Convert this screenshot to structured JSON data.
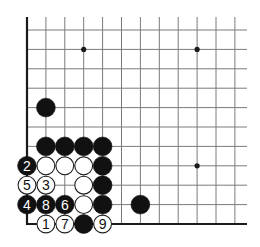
{
  "diagram": {
    "board": {
      "corner": "bottom-left",
      "visible_columns": 12,
      "visible_rows": 11,
      "origin": {
        "x": 27,
        "y": 224
      },
      "col_spacing": 18.9,
      "row_spacing": 19.4,
      "top_line_extent": 17,
      "right_line_extent": 247,
      "colors": {
        "background": "#ffffff",
        "grid_line": "#7a7a7a",
        "edge_line": "#1a1a1a",
        "black_stone": "#111111",
        "white_stone": "#ffffff",
        "white_stone_border": "#222222",
        "label_on_black": "#ffffff",
        "label_on_white": "#111111"
      }
    },
    "star_points": [
      {
        "col": 3,
        "row": 9
      },
      {
        "col": 9,
        "row": 9
      },
      {
        "col": 9,
        "row": 3
      }
    ],
    "stones": [
      {
        "col": 1,
        "row": 6,
        "color": "black",
        "label": ""
      },
      {
        "col": 1,
        "row": 4,
        "color": "black",
        "label": ""
      },
      {
        "col": 2,
        "row": 4,
        "color": "black",
        "label": ""
      },
      {
        "col": 3,
        "row": 4,
        "color": "black",
        "label": ""
      },
      {
        "col": 4,
        "row": 4,
        "color": "black",
        "label": ""
      },
      {
        "col": 0,
        "row": 3,
        "color": "black",
        "label": "2"
      },
      {
        "col": 1,
        "row": 3,
        "color": "white",
        "label": ""
      },
      {
        "col": 2,
        "row": 3,
        "color": "white",
        "label": ""
      },
      {
        "col": 3,
        "row": 3,
        "color": "white",
        "label": ""
      },
      {
        "col": 4,
        "row": 3,
        "color": "black",
        "label": ""
      },
      {
        "col": 0,
        "row": 2,
        "color": "white",
        "label": "5"
      },
      {
        "col": 1,
        "row": 2,
        "color": "white",
        "label": "3"
      },
      {
        "col": 3,
        "row": 2,
        "color": "white",
        "label": ""
      },
      {
        "col": 4,
        "row": 2,
        "color": "black",
        "label": ""
      },
      {
        "col": 0,
        "row": 1,
        "color": "black",
        "label": "4"
      },
      {
        "col": 1,
        "row": 1,
        "color": "black",
        "label": "8"
      },
      {
        "col": 2,
        "row": 1,
        "color": "black",
        "label": "6"
      },
      {
        "col": 3,
        "row": 1,
        "color": "white",
        "label": ""
      },
      {
        "col": 4,
        "row": 1,
        "color": "black",
        "label": ""
      },
      {
        "col": 6,
        "row": 1,
        "color": "black",
        "label": ""
      },
      {
        "col": 1,
        "row": 0,
        "color": "white",
        "label": "1"
      },
      {
        "col": 2,
        "row": 0,
        "color": "white",
        "label": "7"
      },
      {
        "col": 3,
        "row": 0,
        "color": "black",
        "label": ""
      },
      {
        "col": 4,
        "row": 0,
        "color": "white",
        "label": "9"
      }
    ]
  }
}
